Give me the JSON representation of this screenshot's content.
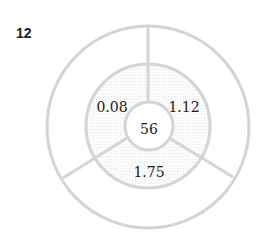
{
  "figure": {
    "number_label": "12",
    "center_value": "56",
    "segments": [
      {
        "position": "upper-left",
        "value": "0.08"
      },
      {
        "position": "upper-right",
        "value": "1.12"
      },
      {
        "position": "bottom",
        "value": "1.75"
      }
    ],
    "colors": {
      "stroke": "#d4d4d4",
      "ring_fill": "#f4f4f4",
      "text": "#1a1a1a"
    }
  }
}
